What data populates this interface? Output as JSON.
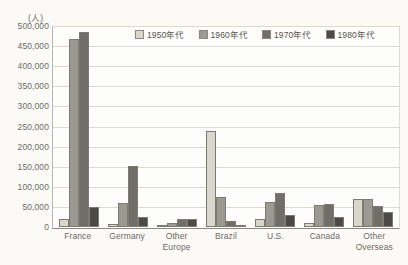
{
  "chart_data": {
    "type": "bar",
    "title": "",
    "xlabel": "",
    "ylabel": "(人)",
    "unit_label": "(人)",
    "ylim": [
      0,
      500000
    ],
    "ytick_step": 50000,
    "grid": true,
    "legend_position": "top-center-inside",
    "categories": [
      "France",
      "Germany",
      "Other\nEurope",
      "Brazil",
      "U.S.",
      "Canada",
      "Other\nOverseas"
    ],
    "category_labels": [
      {
        "line1": "France",
        "line2": ""
      },
      {
        "line1": "Germany",
        "line2": ""
      },
      {
        "line1": "Other",
        "line2": "Europe"
      },
      {
        "line1": "Brazil",
        "line2": ""
      },
      {
        "line1": "U.S.",
        "line2": ""
      },
      {
        "line1": "Canada",
        "line2": ""
      },
      {
        "line1": "Other",
        "line2": "Overseas"
      }
    ],
    "ytick_labels": [
      "0",
      "50,000",
      "100,000",
      "150,000",
      "200,000",
      "250,000",
      "300,000",
      "350,000",
      "400,000",
      "450,000",
      "500,000"
    ],
    "series": [
      {
        "name": "1950年代",
        "color": "#d9d7cc",
        "values": [
          20000,
          8000,
          3000,
          240000,
          20000,
          11000,
          70000
        ]
      },
      {
        "name": "1960年代",
        "color": "#9b9a92",
        "values": [
          468000,
          60000,
          11000,
          75000,
          62000,
          55000,
          70000
        ]
      },
      {
        "name": "1970年代",
        "color": "#6f6e68",
        "values": [
          485000,
          152000,
          20000,
          15000,
          85000,
          58000,
          52000
        ]
      },
      {
        "name": "1980年代",
        "color": "#4b4a46",
        "values": [
          50000,
          25000,
          19000,
          5000,
          30000,
          25000,
          38000
        ]
      }
    ]
  }
}
